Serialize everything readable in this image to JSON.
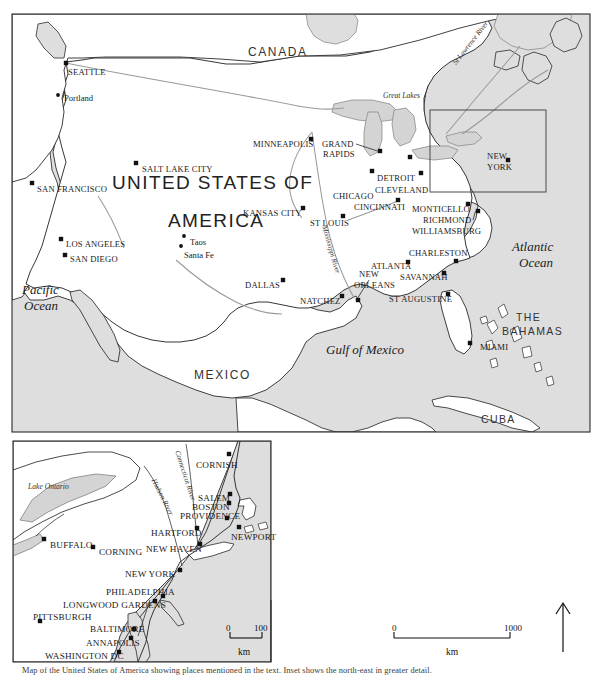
{
  "figure": {
    "type": "reference-map",
    "title_top": "",
    "caption": "Map of the United States of America showing places mentioned in the text. Inset shows the north-east in greater detail.",
    "projection_note": "North America, eastern seaboard inset"
  },
  "main_map": {
    "countries": [
      {
        "name": "CANADA",
        "x": 248,
        "y": 46
      },
      {
        "name": "MEXICO",
        "x": 194,
        "y": 369
      },
      {
        "name": "CUBA",
        "x": 481,
        "y": 414
      },
      {
        "name": "THE",
        "x": 516,
        "y": 312
      },
      {
        "name": "BAHAMAS",
        "x": 502,
        "y": 326
      }
    ],
    "usa_label": {
      "line1": "UNITED STATES OF",
      "line2": "AMERICA",
      "x1": 112,
      "y1": 173,
      "x2": 168,
      "y2": 211
    },
    "oceans": [
      {
        "name": "Pacific",
        "x": 22,
        "y": 283
      },
      {
        "name": "Ocean",
        "x": 24,
        "y": 299
      },
      {
        "name": "Atlantic",
        "x": 512,
        "y": 240
      },
      {
        "name": "Ocean",
        "x": 519,
        "y": 256
      },
      {
        "name": "Gulf of Mexico",
        "x": 326,
        "y": 343
      }
    ],
    "water_labels": [
      {
        "name": "Great Lakes",
        "x": 383,
        "y": 92
      },
      {
        "name": "St Lawrence River",
        "x": 452,
        "y": 62,
        "rotate": -52
      },
      {
        "name": "Mississippi River",
        "x": 327,
        "y": 225,
        "rotate": 74
      }
    ],
    "cities": [
      {
        "name": "SEATTLE",
        "label_x": 68,
        "label_y": 68,
        "mx": 66,
        "my": 63,
        "marker": "square",
        "caps": true
      },
      {
        "name": "Portland",
        "label_x": 64,
        "label_y": 94,
        "mx": 58,
        "my": 95,
        "marker": "dot",
        "caps": false
      },
      {
        "name": "SALT LAKE CITY",
        "label_x": 142,
        "label_y": 165,
        "mx": 136,
        "my": 163,
        "marker": "square",
        "caps": true
      },
      {
        "name": "SAN FRANCISCO",
        "label_x": 37,
        "label_y": 185,
        "mx": 32,
        "my": 183,
        "marker": "square",
        "caps": true
      },
      {
        "name": "LOS ANGELES",
        "label_x": 66,
        "label_y": 240,
        "mx": 61,
        "my": 239,
        "marker": "square",
        "caps": true
      },
      {
        "name": "SAN DIEGO",
        "label_x": 70,
        "label_y": 255,
        "mx": 65,
        "my": 255,
        "marker": "square",
        "caps": true
      },
      {
        "name": "Taos",
        "label_x": 190,
        "label_y": 238,
        "mx": 184,
        "my": 236,
        "marker": "dot",
        "caps": false
      },
      {
        "name": "Santa Fe",
        "label_x": 184,
        "label_y": 251,
        "mx": 181,
        "my": 246,
        "marker": "dot",
        "caps": false
      },
      {
        "name": "DALLAS",
        "label_x": 245,
        "label_y": 281,
        "mx": 283,
        "my": 280,
        "marker": "square",
        "caps": true
      },
      {
        "name": "MINNEAPOLIS",
        "label_x": 253,
        "label_y": 140,
        "mx": 311,
        "my": 139,
        "marker": "square",
        "caps": true
      },
      {
        "name": "GRAND",
        "label_x": 322,
        "label_y": 140,
        "mx": 380,
        "my": 151,
        "marker": "square",
        "caps": true
      },
      {
        "name": "RAPIDS",
        "label_x": 323,
        "label_y": 150,
        "mx": -1,
        "my": -1,
        "marker": "none",
        "caps": true
      },
      {
        "name": "KANSAS CITY",
        "label_x": 243,
        "label_y": 209,
        "mx": 303,
        "my": 208,
        "marker": "square",
        "caps": true
      },
      {
        "name": "ST LOUIS",
        "label_x": 310,
        "label_y": 219,
        "mx": 343,
        "my": 216,
        "marker": "square",
        "caps": true
      },
      {
        "name": "CHICAGO",
        "label_x": 333,
        "label_y": 192,
        "mx": 372,
        "my": 171,
        "marker": "square",
        "caps": true
      },
      {
        "name": "DETROIT",
        "label_x": 377,
        "label_y": 174,
        "mx": 410,
        "my": 157,
        "marker": "square",
        "caps": true
      },
      {
        "name": "CLEVELAND",
        "label_x": 375,
        "label_y": 186,
        "mx": 421,
        "my": 173,
        "marker": "square",
        "caps": true
      },
      {
        "name": "CINCINNATI",
        "label_x": 354,
        "label_y": 203,
        "mx": 398,
        "my": 200,
        "marker": "square",
        "caps": true
      },
      {
        "name": "NEW",
        "label_x": 487,
        "label_y": 152,
        "mx": 508,
        "my": 160,
        "marker": "square",
        "caps": true
      },
      {
        "name": "YORK",
        "label_x": 487,
        "label_y": 163,
        "mx": -1,
        "my": -1,
        "marker": "none",
        "caps": true
      },
      {
        "name": "MONTICELLO",
        "label_x": 412,
        "label_y": 205,
        "mx": 468,
        "my": 204,
        "marker": "square",
        "caps": true
      },
      {
        "name": "RICHMOND",
        "label_x": 423,
        "label_y": 216,
        "mx": 478,
        "my": 211,
        "marker": "square",
        "caps": true
      },
      {
        "name": "WILLIAMSBURG",
        "label_x": 412,
        "label_y": 227,
        "mx": -1,
        "my": -1,
        "marker": "none",
        "caps": true
      },
      {
        "name": "CHARLESTON",
        "label_x": 409,
        "label_y": 249,
        "mx": 456,
        "my": 261,
        "marker": "square",
        "caps": true
      },
      {
        "name": "ATLANTA",
        "label_x": 371,
        "label_y": 262,
        "mx": 408,
        "my": 262,
        "marker": "square",
        "caps": true
      },
      {
        "name": "SAVANNAH",
        "label_x": 400,
        "label_y": 273,
        "mx": 444,
        "my": 273,
        "marker": "square",
        "caps": true
      },
      {
        "name": "NEW",
        "label_x": 359,
        "label_y": 270,
        "mx": 358,
        "my": 300,
        "marker": "square",
        "caps": true
      },
      {
        "name": "ORLEANS",
        "label_x": 354,
        "label_y": 281,
        "mx": -1,
        "my": -1,
        "marker": "none",
        "caps": true
      },
      {
        "name": "ST AUGUSTINE",
        "label_x": 389,
        "label_y": 295,
        "mx": 448,
        "my": 294,
        "marker": "square",
        "caps": true
      },
      {
        "name": "NATCHEZ",
        "label_x": 300,
        "label_y": 297,
        "mx": 342,
        "my": 296,
        "marker": "square",
        "caps": true
      },
      {
        "name": "MIAMI",
        "label_x": 480,
        "label_y": 343,
        "mx": 470,
        "my": 343,
        "marker": "square",
        "caps": true
      }
    ]
  },
  "inset_map": {
    "water_labels": [
      {
        "name": "Lake Ontario",
        "x": 28,
        "y": 483
      },
      {
        "name": "Hudson River",
        "x": 156,
        "y": 478,
        "rotate": 63
      },
      {
        "name": "Connecticut River",
        "x": 180,
        "y": 450,
        "rotate": 72
      }
    ],
    "cities": [
      {
        "name": "CORNISH",
        "label_x": 196,
        "label_y": 461,
        "mx": 229,
        "my": 454,
        "marker": "square"
      },
      {
        "name": "SALEM",
        "label_x": 198,
        "label_y": 494,
        "mx": 230,
        "my": 494,
        "marker": "square"
      },
      {
        "name": "BOSTON",
        "label_x": 192,
        "label_y": 503,
        "mx": 229,
        "my": 503,
        "marker": "square"
      },
      {
        "name": "PROVIDENCE",
        "label_x": 180,
        "label_y": 512,
        "mx": 227,
        "my": 518,
        "marker": "square"
      },
      {
        "name": "NEWPORT",
        "label_x": 231,
        "label_y": 533,
        "mx": 239,
        "my": 527,
        "marker": "square"
      },
      {
        "name": "HARTFORD",
        "label_x": 151,
        "label_y": 529,
        "mx": 197,
        "my": 528,
        "marker": "square"
      },
      {
        "name": "NEW HAVEN",
        "label_x": 146,
        "label_y": 545,
        "mx": 200,
        "my": 544,
        "marker": "square"
      },
      {
        "name": "BUFFALO",
        "label_x": 50,
        "label_y": 541,
        "mx": 44,
        "my": 539,
        "marker": "square"
      },
      {
        "name": "CORNING",
        "label_x": 99,
        "label_y": 548,
        "mx": 93,
        "my": 547,
        "marker": "square"
      },
      {
        "name": "NEW YORK",
        "label_x": 125,
        "label_y": 570,
        "mx": 180,
        "my": 570,
        "marker": "square"
      },
      {
        "name": "PHILADELPHIA",
        "label_x": 106,
        "label_y": 588,
        "mx": 163,
        "my": 596,
        "marker": "square"
      },
      {
        "name": "LONGWOOD GARDENS",
        "label_x": 63,
        "label_y": 601,
        "mx": 155,
        "my": 601,
        "marker": "square"
      },
      {
        "name": "PITTSBURGH",
        "label_x": 33,
        "label_y": 613,
        "mx": 40,
        "my": 621,
        "marker": "square"
      },
      {
        "name": "BALTIMORE",
        "label_x": 90,
        "label_y": 625,
        "mx": 134,
        "my": 629,
        "marker": "square"
      },
      {
        "name": "ANNAPOLIS",
        "label_x": 86,
        "label_y": 639,
        "mx": 131,
        "my": 638,
        "marker": "square"
      },
      {
        "name": "WASHINGTON DC",
        "label_x": 45,
        "label_y": 652,
        "mx": 119,
        "my": 652,
        "marker": "square"
      }
    ]
  },
  "scale_bars": [
    {
      "id": "inset-scale",
      "min": "0",
      "max": "100",
      "unit": "km",
      "x": 228,
      "y": 624,
      "len": 32
    },
    {
      "id": "main-scale",
      "min": "0",
      "max": "1000",
      "unit": "km",
      "x": 394,
      "y": 624,
      "len": 116
    }
  ],
  "north_arrow": {
    "label": "",
    "x": 563,
    "y": 605
  },
  "colors": {
    "land_fill": "#ffffff",
    "sea_fill": "#dedede",
    "lake_fill": "#d4d4d4",
    "border": "#2b2b2b",
    "river": "#9a9a9a",
    "marker": "#111111",
    "frame": "#3a3a3a"
  }
}
